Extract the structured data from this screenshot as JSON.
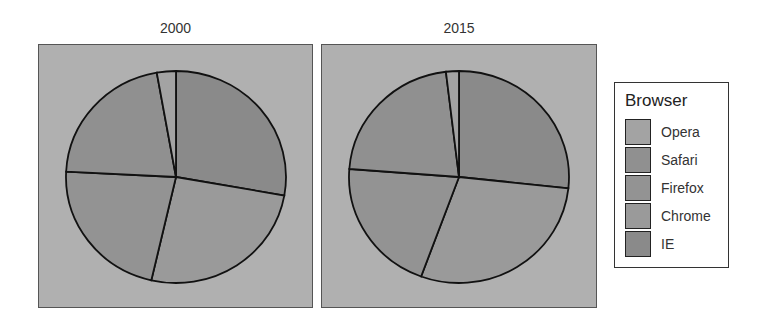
{
  "chart_data": {
    "type": "pie",
    "title": "",
    "facets": [
      "2000",
      "2015"
    ],
    "categories": [
      "Opera",
      "Safari",
      "Firefox",
      "Chrome",
      "IE"
    ],
    "series": [
      {
        "name": "2000",
        "values": [
          2.8,
          21.4,
          22.2,
          25.8,
          27.8
        ]
      },
      {
        "name": "2015",
        "values": [
          1.9,
          21.9,
          20.6,
          28.9,
          26.7
        ]
      }
    ],
    "legend": {
      "title": "Browser",
      "position": "right",
      "entries": [
        "Opera",
        "Safari",
        "Firefox",
        "Chrome",
        "IE"
      ]
    },
    "colors": {
      "Opera": "#a3a3a3",
      "Safari": "#909090",
      "Firefox": "#939393",
      "Chrome": "#9a9a9a",
      "IE": "#8a8a8a"
    },
    "panel_background": "#b0b0b0",
    "xlabel": "",
    "ylabel": ""
  },
  "facet_labels": {
    "left": "2000",
    "right": "2015"
  },
  "legend": {
    "title": "Browser",
    "items": [
      {
        "label": "Opera",
        "color": "#a3a3a3"
      },
      {
        "label": "Safari",
        "color": "#909090"
      },
      {
        "label": "Firefox",
        "color": "#939393"
      },
      {
        "label": "Chrome",
        "color": "#9a9a9a"
      },
      {
        "label": "IE",
        "color": "#8a8a8a"
      }
    ]
  }
}
